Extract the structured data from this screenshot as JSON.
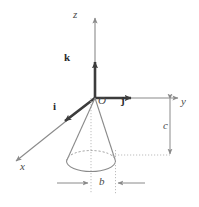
{
  "figure": {
    "background_color": "#ffffff",
    "width": 199,
    "height": 207,
    "colors": {
      "axis_line": "#8a8a8a",
      "thick_axis": "#3c3c3c",
      "cone_outline": "#8a8a8a",
      "dotted_guide": "#b0b0b0",
      "dimension_line": "#8a8a8a",
      "label_text": "#3a3a3a"
    },
    "axes": [
      {
        "id": "z-axis",
        "label": "z",
        "direction": "up",
        "style": "thin-arrow"
      },
      {
        "id": "y-axis",
        "label": "y",
        "direction": "right",
        "style": "thin-arrow"
      },
      {
        "id": "x-axis",
        "label": "x",
        "direction": "down-left",
        "style": "thin-arrow"
      }
    ],
    "unit_vectors": [
      {
        "id": "vector-k",
        "label": "k",
        "along": "z-axis",
        "style": "thick-arrow"
      },
      {
        "id": "vector-j",
        "label": "j",
        "along": "y-axis",
        "style": "thick-arrow"
      },
      {
        "id": "vector-i",
        "label": "i",
        "along": "x-axis",
        "style": "thick-arrow"
      }
    ],
    "origin": {
      "id": "origin",
      "label": "O"
    },
    "dimensions": [
      {
        "id": "height-dimension",
        "label": "c",
        "orientation": "vertical",
        "describes": "distance from the xy-plane down to the cone base"
      },
      {
        "id": "radius-dimension",
        "label": "b",
        "orientation": "horizontal",
        "describes": "radius of the circular cone base"
      }
    ],
    "shape": {
      "id": "cone",
      "kind": "right circular cone",
      "apex": "at origin O",
      "base": "circle drawn as dashed-top ellipse below the origin"
    }
  }
}
